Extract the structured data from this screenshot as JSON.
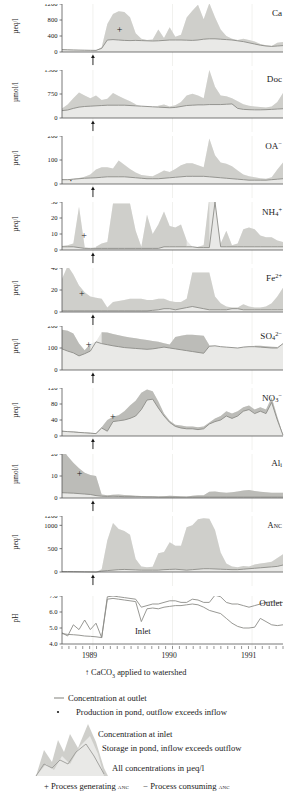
{
  "figure": {
    "caption_arrow": "CaCO",
    "caption_sub": "3",
    "caption_rest": " applied to watershed",
    "x_years": [
      "1989",
      "1990",
      "1991"
    ],
    "inlet_label": "Inlet",
    "outlet_label": "Outlet"
  },
  "legend": {
    "line_outlet": "Concentration at outlet",
    "dot_production": "Production in pond, outflow exceeds inflow",
    "line_inlet": "Concentration at inlet",
    "storage": "Storage in pond, inflow exceeds outflow",
    "units": "All concentrations in µeq/l",
    "plus_sym": "+",
    "plus_text": "Process generating ",
    "plus_anc": "anc",
    "minus_sym": "−",
    "minus_text": "Process consuming ",
    "minus_anc": "anc"
  },
  "colors": {
    "light_fill": "#e9e9e7",
    "dark_fill": "#b9b9b5",
    "line": "#8c8c88",
    "axis": "#555555",
    "gridline": "#ededea",
    "text": "#1a1a1a"
  },
  "chart_data": {
    "type": "area",
    "xlabel": "",
    "xlim": [
      0,
      100
    ],
    "xticklabels": [
      "1989",
      "1990",
      "1991"
    ],
    "xtickpos": [
      14,
      50,
      86
    ],
    "lime_application_x": 14,
    "note": "Each panel: light grey = storage/production envelope between inlet and outlet, dark grey = inflow exceeds outflow. Values sampled at 40 evenly spaced dates across the record.",
    "panels": [
      {
        "name": "Ca",
        "title": "Ca",
        "ylabel": "µeq/l",
        "ylim": [
          0,
          1200
        ],
        "yticks": [
          0,
          400,
          800,
          1200
        ],
        "marker": "+",
        "marker_x": 26,
        "marker_y": 560,
        "outlet": [
          60,
          55,
          50,
          48,
          45,
          42,
          40,
          90,
          300,
          310,
          300,
          290,
          285,
          290,
          285,
          280,
          275,
          280,
          290,
          300,
          300,
          300,
          295,
          290,
          300,
          320,
          330,
          330,
          320,
          310,
          300,
          280,
          260,
          230,
          200,
          170,
          150,
          140,
          150,
          160
        ],
        "inlet": [
          70,
          60,
          55,
          50,
          48,
          45,
          42,
          120,
          700,
          950,
          1020,
          1000,
          870,
          470,
          330,
          300,
          310,
          560,
          350,
          620,
          380,
          430,
          860,
          1030,
          1180,
          820,
          1220,
          870,
          560,
          400,
          330,
          300,
          330,
          300,
          260,
          200,
          170,
          150,
          230,
          250
        ]
      },
      {
        "name": "Doc",
        "title": "Doc",
        "ylabel": "µmol/l",
        "ylim": [
          0,
          1500
        ],
        "yticks": [
          0,
          750,
          1500
        ],
        "marker": null,
        "outlet": [
          230,
          250,
          300,
          340,
          360,
          370,
          380,
          390,
          400,
          400,
          400,
          400,
          390,
          380,
          370,
          360,
          350,
          340,
          330,
          320,
          330,
          360,
          390,
          400,
          410,
          410,
          420,
          420,
          420,
          430,
          440,
          300,
          270,
          260,
          255,
          255,
          260,
          270,
          280,
          290
        ],
        "inlet": [
          300,
          420,
          620,
          800,
          700,
          620,
          700,
          560,
          600,
          780,
          690,
          600,
          520,
          430,
          360,
          330,
          300,
          380,
          420,
          360,
          400,
          500,
          700,
          760,
          700,
          620,
          1500,
          980,
          700,
          680,
          620,
          520,
          430,
          380,
          360,
          340,
          330,
          360,
          500,
          780
        ]
      },
      {
        "name": "OA",
        "title": "OA",
        "title_sup": "−",
        "ylabel": "µeq/l",
        "ylim": [
          0,
          200
        ],
        "yticks": [
          0,
          100,
          200
        ],
        "marker": "·",
        "marker_x": 4,
        "marker_y": 12,
        "outlet": [
          18,
          18,
          20,
          22,
          24,
          25,
          26,
          28,
          30,
          30,
          30,
          30,
          28,
          26,
          24,
          22,
          22,
          22,
          24,
          26,
          28,
          30,
          32,
          32,
          32,
          32,
          30,
          28,
          26,
          24,
          22,
          20,
          18,
          16,
          16,
          16,
          16,
          18,
          20,
          22
        ],
        "inlet": [
          20,
          20,
          22,
          25,
          30,
          40,
          60,
          70,
          70,
          65,
          98,
          80,
          62,
          48,
          38,
          34,
          32,
          44,
          56,
          50,
          62,
          78,
          86,
          86,
          78,
          70,
          190,
          120,
          90,
          84,
          74,
          56,
          40,
          32,
          28,
          24,
          22,
          28,
          60,
          90
        ]
      },
      {
        "name": "NH4",
        "title": "NH",
        "title_sub": "4",
        "title_sup": "+",
        "ylabel": "µeq/l",
        "ylim": [
          0,
          30
        ],
        "yticks": [
          0,
          10,
          20,
          30
        ],
        "marker": "+",
        "marker_x": 10,
        "marker_y": 9,
        "outlet": [
          2,
          2,
          2,
          1.5,
          1,
          1,
          1,
          1,
          1,
          1,
          1,
          1,
          1,
          1,
          1,
          1,
          1,
          1,
          2,
          2,
          2,
          2,
          2,
          2,
          1.5,
          1.5,
          1.5,
          30,
          2,
          2,
          2,
          2,
          2,
          2,
          2,
          2,
          2,
          2,
          2,
          2
        ],
        "inlet": [
          2.5,
          3,
          4,
          27,
          2,
          0.5,
          2,
          4,
          5,
          29,
          29,
          29,
          29,
          12,
          2,
          22,
          10,
          16,
          24,
          15,
          14,
          16,
          6,
          2,
          2,
          3,
          33,
          30,
          4,
          12,
          3,
          4,
          13,
          14,
          13,
          9,
          8,
          8,
          6,
          5
        ]
      },
      {
        "name": "Fe2",
        "title": "Fe",
        "title_sup": "2+",
        "ylabel": "µeq/l",
        "ylim": [
          0,
          40
        ],
        "yticks": [
          0,
          20,
          40
        ],
        "marker": "+",
        "marker_x": 9,
        "marker_y": 16,
        "outlet": [
          1,
          1,
          1,
          1,
          1,
          1,
          1,
          1,
          1,
          1,
          1,
          1,
          1,
          1,
          1,
          1,
          1.5,
          2,
          3,
          3,
          2,
          3,
          4,
          5,
          4,
          3,
          2,
          2,
          2,
          2,
          3,
          3,
          2,
          2,
          2,
          2,
          2,
          2,
          2,
          2
        ],
        "inlet": [
          30,
          42,
          34,
          24,
          18,
          14,
          13,
          12,
          4,
          9,
          10,
          11,
          12,
          12,
          12,
          11,
          11,
          12,
          12,
          10,
          9,
          9,
          12,
          36,
          36,
          36,
          36,
          14,
          8,
          5,
          4,
          4,
          7,
          5,
          4,
          4,
          5,
          8,
          14,
          22
        ]
      },
      {
        "name": "SO4",
        "title": "SO",
        "title_sub": "4",
        "title_sup": "2−",
        "ylabel": "µeq/l",
        "ylim": [
          0,
          200
        ],
        "yticks": [
          0,
          100,
          200
        ],
        "marker": "+",
        "marker_x": 12,
        "marker_y": 115,
        "outlet": [
          96,
          86,
          78,
          64,
          74,
          86,
          128,
          120,
          115,
          110,
          106,
          102,
          100,
          98,
          96,
          94,
          96,
          100,
          104,
          100,
          96,
          92,
          88,
          84,
          80,
          76,
          108,
          110,
          106,
          104,
          102,
          100,
          104,
          106,
          106,
          104,
          102,
          100,
          100,
          120
        ],
        "inlet": [
          183,
          178,
          166,
          120,
          90,
          118,
          130,
          172,
          170,
          164,
          158,
          152,
          148,
          144,
          140,
          136,
          132,
          128,
          122,
          116,
          150,
          156,
          160,
          160,
          158,
          156,
          112,
          108,
          104,
          102,
          100,
          98,
          106,
          108,
          110,
          110,
          108,
          106,
          104,
          118
        ]
      },
      {
        "name": "NO3",
        "title": "NO",
        "title_sub": "3",
        "title_sup": "−",
        "ylabel": "µeq/l",
        "ylim": [
          0,
          120
        ],
        "yticks": [
          0,
          40,
          80,
          120
        ],
        "marker": "+",
        "marker_x": 23,
        "marker_y": 47,
        "outlet": [
          12,
          11,
          10,
          9,
          8,
          7,
          6,
          20,
          12,
          36,
          38,
          40,
          44,
          50,
          66,
          90,
          92,
          70,
          50,
          34,
          24,
          20,
          18,
          18,
          16,
          18,
          30,
          36,
          40,
          50,
          44,
          50,
          62,
          66,
          56,
          62,
          56,
          84,
          40,
          2
        ],
        "inlet": [
          13,
          12,
          11,
          10,
          9,
          8,
          7,
          22,
          40,
          48,
          52,
          62,
          76,
          88,
          108,
          116,
          112,
          86,
          56,
          38,
          28,
          26,
          24,
          24,
          22,
          24,
          34,
          44,
          50,
          62,
          56,
          62,
          72,
          76,
          66,
          72,
          66,
          96,
          48,
          4
        ]
      },
      {
        "name": "Ali",
        "title": "Al",
        "title_sub": "i",
        "ylabel": "µmol/l",
        "ylim": [
          0,
          20
        ],
        "yticks": [
          0,
          10,
          20
        ],
        "marker": "+",
        "marker_x": 8,
        "marker_y": 11,
        "outlet": [
          2.4,
          2.3,
          2.2,
          2.0,
          1.8,
          1.6,
          1.1,
          0.8,
          0.7,
          0.8,
          0.7,
          0.6,
          0.6,
          0.6,
          0.6,
          0.5,
          0.5,
          0.4,
          0.4,
          0.4,
          0.4,
          0.4,
          0.4,
          0.4,
          0.4,
          0.4,
          0.4,
          0.4,
          0.4,
          0.4,
          0.4,
          0.4,
          0.4,
          0.4,
          0.4,
          0.4,
          0.4,
          0.4,
          0.4,
          0.4
        ],
        "inlet": [
          22.5,
          19,
          16,
          13.5,
          11.5,
          10.5,
          10,
          1.6,
          1.2,
          1.5,
          1.6,
          1.4,
          1.3,
          1.0,
          0.9,
          0.8,
          0.8,
          0.7,
          0.8,
          1.0,
          0.9,
          0.7,
          0.6,
          1.0,
          1.2,
          1.3,
          2.8,
          3.0,
          2.6,
          2.4,
          2.6,
          3.0,
          3.4,
          3.6,
          3.2,
          2.8,
          2.6,
          2.4,
          2.4,
          2.4
        ]
      },
      {
        "name": "Anc",
        "title": "Anc",
        "ylabel": "µeq/l",
        "ylim": [
          0,
          1200
        ],
        "yticks": [
          0,
          500,
          1000,
          1200
        ],
        "marker": null,
        "outlet": [
          10,
          10,
          8,
          6,
          4,
          2,
          0,
          20,
          30,
          40,
          50,
          55,
          50,
          45,
          40,
          40,
          40,
          40,
          50,
          55,
          60,
          50,
          40,
          50,
          60,
          70,
          70,
          65,
          60,
          55,
          50,
          50,
          60,
          70,
          80,
          90,
          100,
          110,
          120,
          150
        ],
        "inlet": [
          15,
          12,
          10,
          8,
          6,
          4,
          2,
          60,
          680,
          1050,
          920,
          880,
          800,
          280,
          120,
          100,
          110,
          400,
          430,
          640,
          560,
          560,
          960,
          1000,
          1130,
          1150,
          1140,
          900,
          420,
          180,
          120,
          100,
          130,
          120,
          160,
          180,
          200,
          220,
          300,
          380
        ]
      },
      {
        "name": "pH",
        "title": "Outlet",
        "ylabel": "pH",
        "ylim": [
          4.0,
          7.0
        ],
        "yticks": [
          4.0,
          5.0,
          6.0,
          7.0
        ],
        "ytickfmt": [
          "4.0",
          "5.0",
          "6.0",
          "7.0"
        ],
        "marker": null,
        "outlet": [
          4.7,
          4.5,
          5.2,
          4.9,
          5.5,
          4.9,
          5.3,
          4.4,
          6.95,
          7.0,
          6.95,
          6.9,
          6.85,
          6.8,
          6.3,
          6.4,
          6.5,
          6.5,
          6.6,
          6.7,
          6.7,
          6.6,
          6.6,
          6.8,
          6.75,
          6.6,
          6.6,
          7.05,
          6.95,
          6.6,
          6.5,
          6.5,
          6.4,
          6.3,
          6.4,
          6.5,
          6.6,
          6.65,
          6.6,
          6.6
        ],
        "inlet": [
          4.65,
          4.6,
          4.58,
          4.55,
          4.5,
          4.48,
          4.45,
          4.4,
          6.8,
          6.85,
          6.8,
          6.75,
          6.7,
          6.65,
          5.4,
          6.2,
          6.25,
          6.2,
          6.3,
          6.35,
          6.4,
          6.4,
          6.45,
          6.5,
          6.45,
          6.3,
          6.1,
          6.0,
          5.9,
          5.6,
          5.3,
          5.1,
          5.0,
          5.0,
          5.05,
          5.6,
          5.4,
          5.2,
          5.15,
          5.2
        ]
      }
    ]
  }
}
